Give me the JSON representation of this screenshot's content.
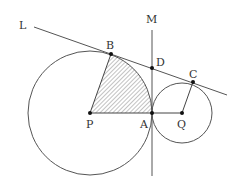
{
  "diagram": {
    "colors": {
      "stroke": "#555555",
      "point": "#111111",
      "hatch": "#777777",
      "label": "#333333"
    },
    "labels": {
      "L": "L",
      "M": "M",
      "B": "B",
      "D": "D",
      "C": "C",
      "P": "P",
      "A": "A",
      "Q": "Q"
    },
    "points": {
      "P": [
        90,
        113
      ],
      "A": [
        152,
        113
      ],
      "Q": [
        182,
        113
      ],
      "B": [
        111,
        54
      ],
      "D": [
        152,
        68
      ],
      "C": [
        193,
        82
      ]
    },
    "circles": [
      {
        "name": "circle-P",
        "center": "P",
        "r": 62
      },
      {
        "name": "circle-Q",
        "center": "Q",
        "r": 30
      }
    ],
    "lines": {
      "L": {
        "from": [
          34,
          27
        ],
        "to": [
          227,
          95
        ]
      },
      "M": {
        "from": [
          152,
          30
        ],
        "to": [
          152,
          176
        ]
      }
    },
    "shaded_region": "P-B-(arc BA)-A"
  }
}
